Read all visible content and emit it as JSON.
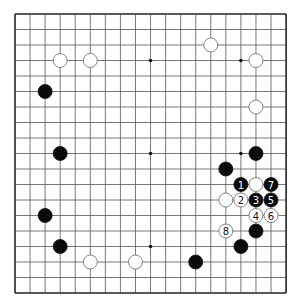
{
  "board": {
    "size": 19,
    "origin": [
      15,
      14
    ],
    "spacing": [
      15.06,
      15.5
    ],
    "stone_radius": 7,
    "line_color": "#555555",
    "border_color": "#222222",
    "star_points": [
      [
        3,
        3
      ],
      [
        9,
        3
      ],
      [
        15,
        3
      ],
      [
        3,
        9
      ],
      [
        9,
        9
      ],
      [
        15,
        9
      ],
      [
        3,
        15
      ],
      [
        9,
        15
      ],
      [
        15,
        15
      ]
    ]
  },
  "stones": [
    {
      "color": "white",
      "col": 3,
      "row": 3
    },
    {
      "color": "white",
      "col": 5,
      "row": 3
    },
    {
      "color": "white",
      "col": 13,
      "row": 2
    },
    {
      "color": "white",
      "col": 16,
      "row": 3
    },
    {
      "color": "white",
      "col": 16,
      "row": 6
    },
    {
      "color": "white",
      "col": 16,
      "row": 11
    },
    {
      "color": "white",
      "col": 14,
      "row": 12
    },
    {
      "color": "white",
      "col": 5,
      "row": 16
    },
    {
      "color": "white",
      "col": 8,
      "row": 16
    },
    {
      "color": "black",
      "col": 2,
      "row": 5
    },
    {
      "color": "black",
      "col": 3,
      "row": 9
    },
    {
      "color": "black",
      "col": 2,
      "row": 13
    },
    {
      "color": "black",
      "col": 3,
      "row": 15
    },
    {
      "color": "black",
      "col": 16,
      "row": 9
    },
    {
      "color": "black",
      "col": 14,
      "row": 10
    },
    {
      "color": "black",
      "col": 16,
      "row": 14
    },
    {
      "color": "black",
      "col": 15,
      "row": 15
    },
    {
      "color": "black",
      "col": 12,
      "row": 16
    }
  ],
  "moves": [
    {
      "number": "1",
      "color": "black",
      "col": 15,
      "row": 11
    },
    {
      "number": "2",
      "color": "white",
      "col": 15,
      "row": 12
    },
    {
      "number": "3",
      "color": "black",
      "col": 16,
      "row": 12
    },
    {
      "number": "4",
      "color": "white",
      "col": 16,
      "row": 13
    },
    {
      "number": "5",
      "color": "black",
      "col": 17,
      "row": 12
    },
    {
      "number": "6",
      "color": "white",
      "col": 17,
      "row": 13
    },
    {
      "number": "7",
      "color": "black",
      "col": 17,
      "row": 11
    },
    {
      "number": "8",
      "color": "white",
      "col": 14,
      "row": 14
    }
  ]
}
